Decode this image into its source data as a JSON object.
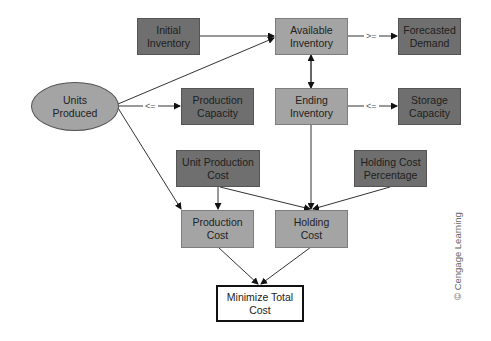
{
  "diagram": {
    "type": "influence-diagram",
    "nodes": {
      "initial_inventory": {
        "label": "Initial\nInventory",
        "line1": "Initial",
        "line2": "Inventory",
        "shape": "rect",
        "fill": "#6f6f6f"
      },
      "available_inventory": {
        "line1": "Available",
        "line2": "Inventory",
        "shape": "rect",
        "fill": "#a4a4a4"
      },
      "forecasted_demand": {
        "line1": "Forecasted",
        "line2": "Demand",
        "shape": "rect",
        "fill": "#6f6f6f"
      },
      "units_produced": {
        "line1": "Units",
        "line2": "Produced",
        "shape": "ellipse",
        "fill": "#a4a4a4"
      },
      "production_capacity": {
        "line1": "Production",
        "line2": "Capacity",
        "shape": "rect",
        "fill": "#6f6f6f"
      },
      "ending_inventory": {
        "line1": "Ending",
        "line2": "Inventory",
        "shape": "rect",
        "fill": "#a4a4a4"
      },
      "storage_capacity": {
        "line1": "Storage",
        "line2": "Capacity",
        "shape": "rect",
        "fill": "#6f6f6f"
      },
      "unit_production_cost": {
        "line1": "Unit Production",
        "line2": "Cost",
        "shape": "rect",
        "fill": "#6f6f6f"
      },
      "holding_cost_percentage": {
        "line1": "Holding Cost",
        "line2": "Percentage",
        "shape": "rect",
        "fill": "#6f6f6f"
      },
      "production_cost": {
        "line1": "Production",
        "line2": "Cost",
        "shape": "rect",
        "fill": "#a4a4a4"
      },
      "holding_cost": {
        "line1": "Holding",
        "line2": "Cost",
        "shape": "rect",
        "fill": "#a4a4a4"
      },
      "minimize_total_cost": {
        "line1": "Minimize Total",
        "line2": "Cost",
        "shape": "rect-bold",
        "fill": "#ffffff"
      }
    },
    "constraints": {
      "available_vs_demand": ">=",
      "units_vs_capacity": "<=",
      "ending_vs_storage": "<="
    },
    "edges": [
      {
        "from": "Initial Inventory",
        "to": "Available Inventory"
      },
      {
        "from": "Units Produced",
        "to": "Available Inventory"
      },
      {
        "from": "Available Inventory",
        "to": "Ending Inventory",
        "bidirectional": true
      },
      {
        "from": "Available Inventory",
        "to": "Forecasted Demand",
        "label": ">="
      },
      {
        "from": "Units Produced",
        "to": "Production Capacity",
        "label": "<="
      },
      {
        "from": "Ending Inventory",
        "to": "Storage Capacity",
        "label": "<="
      },
      {
        "from": "Units Produced",
        "to": "Production Cost"
      },
      {
        "from": "Unit Production Cost",
        "to": "Production Cost"
      },
      {
        "from": "Unit Production Cost",
        "to": "Holding Cost"
      },
      {
        "from": "Ending Inventory",
        "to": "Holding Cost"
      },
      {
        "from": "Holding Cost Percentage",
        "to": "Holding Cost"
      },
      {
        "from": "Production Cost",
        "to": "Minimize Total Cost"
      },
      {
        "from": "Holding Cost",
        "to": "Minimize Total Cost"
      }
    ]
  },
  "credit": "© Cengage Learning"
}
